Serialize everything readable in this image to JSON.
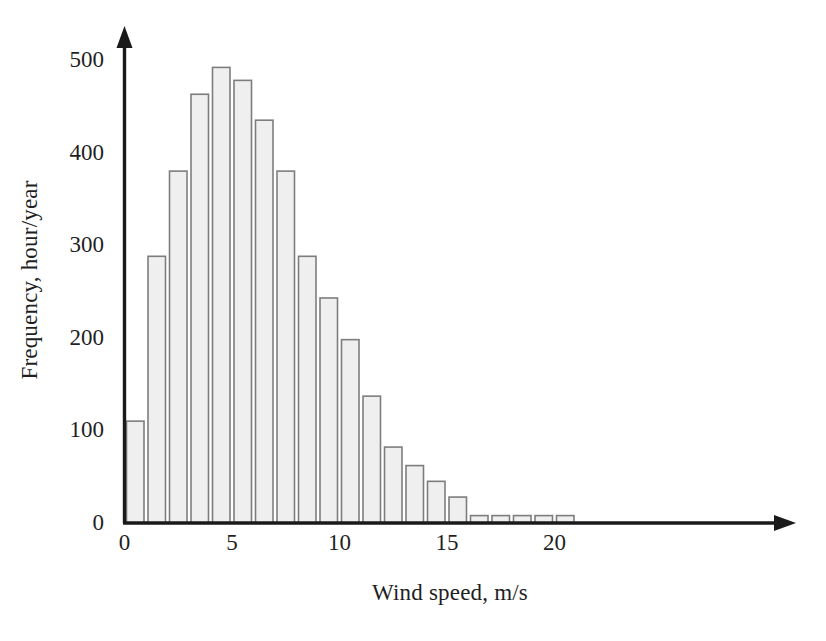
{
  "chart_data": {
    "type": "bar",
    "title": "",
    "subtitle": "",
    "xlabel": "Wind speed, m/s",
    "ylabel": "Frequency, hour/year",
    "xlim": [
      0,
      22
    ],
    "ylim": [
      0,
      520
    ],
    "grid": false,
    "legend": null,
    "x_ticks": [
      "0",
      "5",
      "10",
      "15",
      "20"
    ],
    "x_tick_values": [
      0,
      5,
      10,
      15,
      20
    ],
    "y_ticks": [
      "0",
      "100",
      "200",
      "300",
      "400",
      "500"
    ],
    "y_tick_values": [
      0,
      100,
      200,
      300,
      400,
      500
    ],
    "bin_width": 1,
    "x": [
      0.5,
      1.5,
      2.5,
      3.5,
      4.5,
      5.5,
      6.5,
      7.5,
      8.5,
      9.5,
      10.5,
      11.5,
      12.5,
      13.5,
      14.5,
      15.5,
      16.5,
      17.5,
      18.5,
      19.5,
      20.5
    ],
    "categories": [
      "0-1",
      "1-2",
      "2-3",
      "3-4",
      "4-5",
      "5-6",
      "6-7",
      "7-8",
      "8-9",
      "9-10",
      "10-11",
      "11-12",
      "12-13",
      "13-14",
      "14-15",
      "15-16",
      "16-17",
      "17-18",
      "18-19",
      "19-20",
      "20-21"
    ],
    "values": [
      110,
      288,
      380,
      463,
      492,
      478,
      435,
      380,
      288,
      243,
      198,
      137,
      82,
      62,
      45,
      28,
      8,
      8,
      8,
      8,
      8
    ],
    "series": [
      {
        "name": "Wind speed frequency distribution",
        "values": [
          110,
          288,
          380,
          463,
          492,
          478,
          435,
          380,
          288,
          243,
          198,
          137,
          82,
          62,
          45,
          28,
          8,
          8,
          8,
          8,
          8
        ]
      }
    ],
    "annotations": [],
    "colors": {
      "bar_fill": "#efefef",
      "bar_stroke": "#7d7d7d",
      "axis": "#1a1a1a",
      "background": "#ffffff",
      "text": "#1f1f1f"
    }
  }
}
